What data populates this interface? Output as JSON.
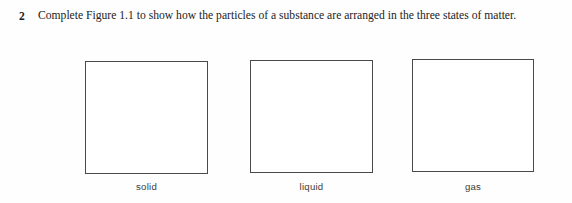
{
  "question": {
    "number": "2",
    "text": "Complete Figure 1.1 to show how the particles of a substance are arranged in the three states of matter."
  },
  "figure": {
    "boxes": [
      {
        "label": "solid"
      },
      {
        "label": "liquid"
      },
      {
        "label": "gas"
      }
    ]
  },
  "colors": {
    "page_background": "#fefefe",
    "text": "#222222",
    "box_border": "#4a4a4c",
    "label_text": "#3b3b3b"
  }
}
